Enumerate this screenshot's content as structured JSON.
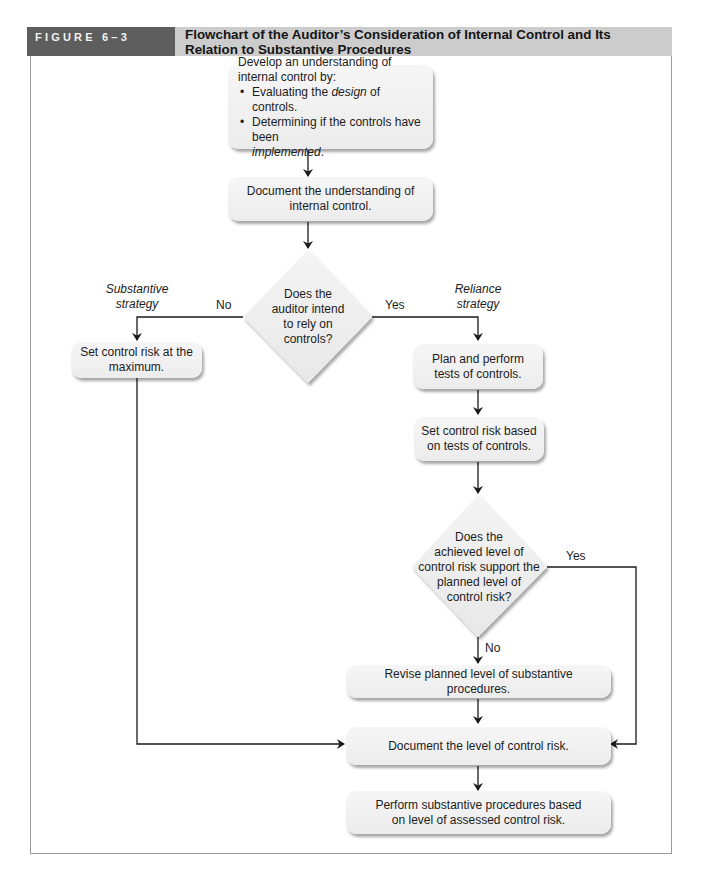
{
  "figure": {
    "label": "FIGURE 6–3",
    "title_line1": "Flowchart of the Auditor’s Consideration of Internal Control and Its",
    "title_line2": "Relation to Substantive Procedures"
  },
  "colors": {
    "header_label_bg": "#5e5e5e",
    "header_title_bg": "#cccccc",
    "box_fill": "#f0f0f0",
    "line": "#1a1a1a"
  },
  "nodes": {
    "develop": {
      "line1": "Develop an understanding of internal control by:",
      "bullet1_pre": "Evaluating the ",
      "bullet1_em": "design",
      "bullet1_post": " of controls.",
      "bullet2_pre": "Determining if the controls have been",
      "bullet2_em": "implemented",
      "bullet2_post": "."
    },
    "document_understanding": {
      "line1": "Document the understanding of",
      "line2": "internal control."
    },
    "decision_rely": {
      "line1": "Does the",
      "line2": "auditor intend",
      "line3": "to rely on",
      "line4": "controls?"
    },
    "set_max": {
      "line1": "Set control risk at the",
      "line2": "maximum."
    },
    "plan_tests": {
      "line1": "Plan and perform",
      "line2": "tests of controls."
    },
    "set_based": {
      "line1": "Set control risk based",
      "line2": "on tests of controls."
    },
    "decision_support": {
      "line1": "Does the",
      "line2": "achieved level of",
      "line3": "control risk support the",
      "line4": "planned level of",
      "line5": "control risk?"
    },
    "revise": {
      "line1": "Revise planned level of substantive procedures."
    },
    "document_level": {
      "line1": "Document the level of control risk."
    },
    "perform": {
      "line1": "Perform substantive procedures based",
      "line2": "on level of assessed control risk."
    }
  },
  "edge_labels": {
    "no1": "No",
    "yes1": "Yes",
    "substantive_1": "Substantive",
    "substantive_2": "strategy",
    "reliance_1": "Reliance",
    "reliance_2": "strategy",
    "yes2": "Yes",
    "no2": "No"
  }
}
